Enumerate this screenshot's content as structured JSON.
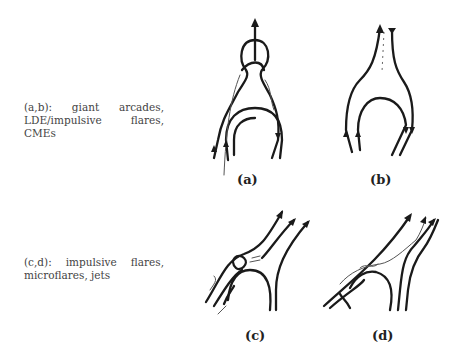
{
  "captions": {
    "ab": "(a,b): giant arcades, LDE/impulsive flares, CMEs",
    "cd": "(c,d): impulsive flares, microflares, jets"
  },
  "panels": [
    {
      "id": "a",
      "label": "(a)"
    },
    {
      "id": "b",
      "label": "(b)"
    },
    {
      "id": "c",
      "label": "(c)"
    },
    {
      "id": "d",
      "label": "(d)"
    }
  ]
}
